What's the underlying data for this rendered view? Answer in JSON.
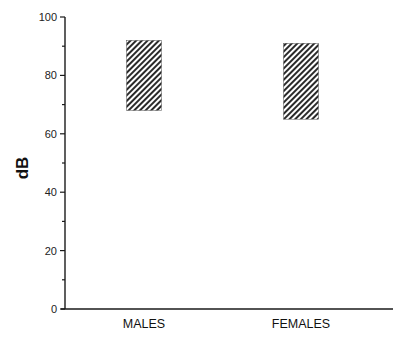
{
  "chart_data": {
    "type": "bar",
    "subtype": "floating-range",
    "title": "",
    "xlabel": "",
    "ylabel": "dB",
    "ylim": [
      0,
      100
    ],
    "yticks": [
      0,
      20,
      40,
      60,
      80,
      100
    ],
    "minor_yticks": [
      10,
      30,
      50,
      70,
      90
    ],
    "grid": false,
    "legend": null,
    "categories": [
      "MALES",
      "FEMALES"
    ],
    "series": [
      {
        "name": "range",
        "low": [
          68,
          65
        ],
        "high": [
          92,
          91
        ],
        "fill": "diagonal-hatch"
      }
    ]
  },
  "colors": {
    "axis": "#1a1a1a",
    "hatch": "#2a2a2a",
    "background": "#ffffff"
  }
}
